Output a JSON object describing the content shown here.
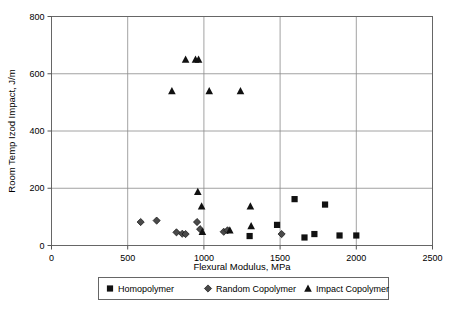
{
  "chart_data": {
    "type": "scatter",
    "title": "",
    "xlabel": "Flexural Modulus, MPa",
    "ylabel": "Room Temp Izod Impact, J/m",
    "xlim": [
      0,
      2500
    ],
    "ylim": [
      0,
      800
    ],
    "xticks": [
      0,
      500,
      1000,
      1500,
      2000,
      2500
    ],
    "yticks": [
      0,
      200,
      400,
      600,
      800
    ],
    "xtick_labels": [
      "0",
      "500",
      "1000",
      "1500",
      "2000",
      "2500"
    ],
    "ytick_labels": [
      "0",
      "200",
      "400",
      "600",
      "800"
    ],
    "grid": "horizontal-and-vertical",
    "legend_position": "below-axis",
    "series": [
      {
        "name": "Homopolymer",
        "marker": "square",
        "color": "#111111",
        "points": [
          {
            "x": 1300,
            "y": 33
          },
          {
            "x": 1480,
            "y": 72
          },
          {
            "x": 1595,
            "y": 162
          },
          {
            "x": 1660,
            "y": 28
          },
          {
            "x": 1725,
            "y": 40
          },
          {
            "x": 1795,
            "y": 143
          },
          {
            "x": 1890,
            "y": 35
          },
          {
            "x": 2000,
            "y": 35
          }
        ]
      },
      {
        "name": "Random Copolymer",
        "marker": "diamond",
        "color": "#4a4a4a",
        "points": [
          {
            "x": 585,
            "y": 82
          },
          {
            "x": 690,
            "y": 87
          },
          {
            "x": 820,
            "y": 46
          },
          {
            "x": 858,
            "y": 41
          },
          {
            "x": 880,
            "y": 40
          },
          {
            "x": 955,
            "y": 82
          },
          {
            "x": 975,
            "y": 57
          },
          {
            "x": 1130,
            "y": 48
          },
          {
            "x": 1155,
            "y": 53
          },
          {
            "x": 1510,
            "y": 40
          }
        ]
      },
      {
        "name": "Impact Copolymer",
        "marker": "triangle",
        "color": "#111111",
        "points": [
          {
            "x": 790,
            "y": 540
          },
          {
            "x": 880,
            "y": 650
          },
          {
            "x": 945,
            "y": 650
          },
          {
            "x": 965,
            "y": 650
          },
          {
            "x": 1035,
            "y": 540
          },
          {
            "x": 1240,
            "y": 540
          },
          {
            "x": 960,
            "y": 188
          },
          {
            "x": 985,
            "y": 137
          },
          {
            "x": 990,
            "y": 48
          },
          {
            "x": 1170,
            "y": 53
          },
          {
            "x": 1305,
            "y": 137
          },
          {
            "x": 1310,
            "y": 68
          }
        ]
      }
    ]
  },
  "legend": {
    "entries": [
      {
        "label": "Homopolymer",
        "marker": "square-marker-icon"
      },
      {
        "label": "Random Copolymer",
        "marker": "diamond-marker-icon"
      },
      {
        "label": "Impact Copolymer",
        "marker": "triangle-marker-icon"
      }
    ]
  }
}
